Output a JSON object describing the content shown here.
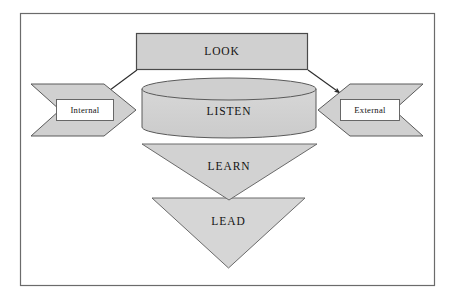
{
  "diagram": {
    "frame": {
      "name": "outer-border",
      "stroke": "#6b6b6b",
      "fill": "#ffffff"
    },
    "palette": {
      "shape_fill": "#d0d0d0",
      "shape_stroke": "#4a4a4a",
      "cylinder_top_fill": "#cfcfcf",
      "label_box_fill": "#ffffff",
      "label_box_stroke": "#5a5a5a",
      "arrow_color": "#2b2b2b",
      "text_color": "#131313",
      "page_background": "#ffffff"
    },
    "nodes": [
      {
        "id": "look",
        "label": "LOOK",
        "shape": "rectangle",
        "role": "top-stage"
      },
      {
        "id": "listen",
        "label": "LISTEN",
        "shape": "cylinder",
        "role": "second-stage"
      },
      {
        "id": "learn",
        "label": "LEARN",
        "shape": "inverted-triangle",
        "role": "third-stage"
      },
      {
        "id": "lead",
        "label": "LEAD",
        "shape": "inverted-triangle",
        "role": "fourth-stage"
      },
      {
        "id": "internal",
        "label": "Internal",
        "shape": "chevron-right",
        "role": "left-input"
      },
      {
        "id": "external",
        "label": "External",
        "shape": "chevron-left",
        "role": "right-input"
      }
    ],
    "connectors": [
      {
        "id": "look-to-internal",
        "from": "look",
        "to": "internal",
        "style": "solid-arrow",
        "direction": "down-left"
      },
      {
        "id": "look-to-external",
        "from": "look",
        "to": "external",
        "style": "solid-arrow",
        "direction": "down-right"
      }
    ]
  }
}
